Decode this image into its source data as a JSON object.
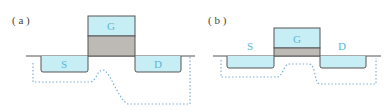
{
  "panels": [
    {
      "id": "a",
      "label": "( a )",
      "gate_label": "G",
      "source_label": "S",
      "drain_label": "D",
      "description": "Gate on thick dielectric; source/drain labels inside wells; dotted channel path dips deep"
    },
    {
      "id": "b",
      "label": "( b )",
      "gate_label": "G",
      "source_label": "S",
      "drain_label": "D",
      "description": "Gate on thin dielectric; source/drain labels above wells; dotted path shallower"
    }
  ],
  "colors": {
    "electrode_fill": "#c8eef5",
    "oxide_fill": "#bdbab6",
    "outline": "#555555",
    "label_text": "#5ab7d6",
    "dotted_path": "#7fb0d6"
  }
}
